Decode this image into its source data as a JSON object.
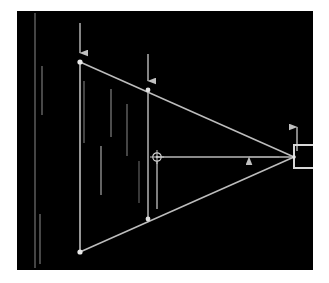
{
  "figure": {
    "title": "",
    "background_color": "#000000",
    "frame_color": "#f2f2f2",
    "stroke_color": "#c8c8c8",
    "node_color": "#e6e6e6",
    "dim_stroke_color": "#8a8a8a",
    "width": 329,
    "height": 283
  },
  "chart_data": {
    "type": "diagram",
    "xlabel": "",
    "ylabel": "",
    "xlim": [
      0,
      296
    ],
    "ylim": [
      0,
      259
    ],
    "grid": false,
    "legend": "none",
    "annotations": [
      "downward load arrow at apex node A",
      "downward load arrow at mid-chord node B",
      "leftward thrust arrow along centroidal axis",
      "upward reaction arrow at roller support"
    ],
    "nodes": [
      {
        "id": "A",
        "label": "A",
        "x": 63,
        "y": 51,
        "kind": "pin-joint"
      },
      {
        "id": "B",
        "label": "B",
        "x": 131,
        "y": 79,
        "kind": "pin-joint"
      },
      {
        "id": "C",
        "label": "C",
        "x": 277,
        "y": 146,
        "kind": "apex"
      },
      {
        "id": "D",
        "label": "D",
        "x": 131,
        "y": 208,
        "kind": "pin-joint"
      },
      {
        "id": "E",
        "label": "E",
        "x": 63,
        "y": 241,
        "kind": "pin-joint"
      },
      {
        "id": "G",
        "label": "G",
        "x": 140,
        "y": 146,
        "kind": "centroid-node"
      }
    ],
    "members": [
      {
        "from": "A",
        "to": "C",
        "kind": "top-chord"
      },
      {
        "from": "E",
        "to": "C",
        "kind": "bottom-chord"
      },
      {
        "from": "A",
        "to": "E",
        "kind": "left-vertical"
      },
      {
        "from": "B",
        "to": "D",
        "kind": "mid-vertical"
      },
      {
        "from": "G",
        "to": "C",
        "kind": "axis-line"
      }
    ],
    "forces": [
      {
        "id": "F1",
        "label": "P1",
        "at": "A",
        "direction": "down",
        "tail_x": 63,
        "tail_y": 12,
        "head_x": 63,
        "head_y": 49
      },
      {
        "id": "F2",
        "label": "P2",
        "at": "B",
        "direction": "down",
        "tail_x": 131,
        "tail_y": 43,
        "head_x": 131,
        "head_y": 77
      },
      {
        "id": "F3",
        "label": "H",
        "at": "axis",
        "direction": "left",
        "tail_x": 277,
        "tail_y": 146,
        "head_x": 222,
        "head_y": 146
      },
      {
        "id": "F4",
        "label": "R",
        "at": "C",
        "direction": "up",
        "tail_x": 280,
        "tail_y": 140,
        "head_x": 280,
        "head_y": 107
      }
    ],
    "support": {
      "kind": "roller-bracket",
      "x": 277,
      "y": 134,
      "width": 26,
      "height": 23
    },
    "dimension_ticks": [
      {
        "id": "t1",
        "x": 25,
        "y1": 55,
        "y2": 104,
        "intensity": "dim"
      },
      {
        "id": "t2",
        "x": 67,
        "y1": 70,
        "y2": 132,
        "intensity": "dim"
      },
      {
        "id": "t3",
        "x": 94,
        "y1": 78,
        "y2": 126,
        "intensity": "dim"
      },
      {
        "id": "t4",
        "x": 110,
        "y1": 93,
        "y2": 145,
        "intensity": "dim"
      },
      {
        "id": "t5",
        "x": 84,
        "y1": 135,
        "y2": 184,
        "intensity": "dim"
      },
      {
        "id": "t6",
        "x": 122,
        "y1": 150,
        "y2": 192,
        "intensity": "dim"
      },
      {
        "id": "t7",
        "x": 23,
        "y1": 203,
        "y2": 253,
        "intensity": "dim"
      },
      {
        "id": "t8",
        "x": 140,
        "y1": 148,
        "y2": 198,
        "intensity": "bright"
      }
    ],
    "reference_lines": [
      {
        "id": "left-datum",
        "x": 18,
        "y1": 2,
        "y2": 257,
        "intensity": "dim"
      }
    ]
  }
}
